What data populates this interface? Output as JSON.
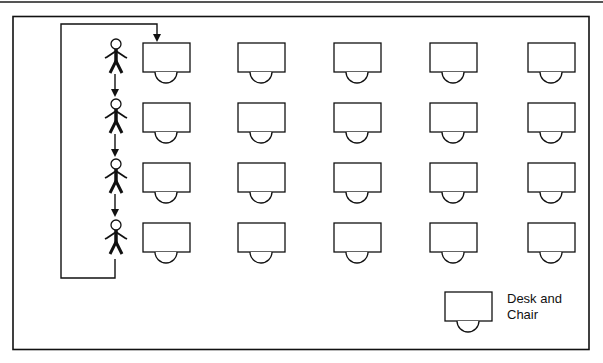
{
  "diagram": {
    "type": "classroom-seating-rotation",
    "rows": 4,
    "columns": 5,
    "students_in_queue": 4,
    "colors": {
      "stroke": "#111111",
      "background": "#ffffff",
      "top_rule": "#555555"
    },
    "legend": {
      "line1": "Desk and",
      "line2": "Chair",
      "label": "Desk and Chair"
    },
    "desk_columns_x": [
      143,
      238,
      334,
      430,
      525
    ],
    "desk_rows_y": [
      43,
      103,
      163,
      223
    ],
    "student_figures_y": [
      40,
      100,
      160,
      220
    ],
    "icons": [
      "student-figure-icon",
      "desk-icon",
      "chair-icon",
      "arrow-down-icon"
    ]
  }
}
